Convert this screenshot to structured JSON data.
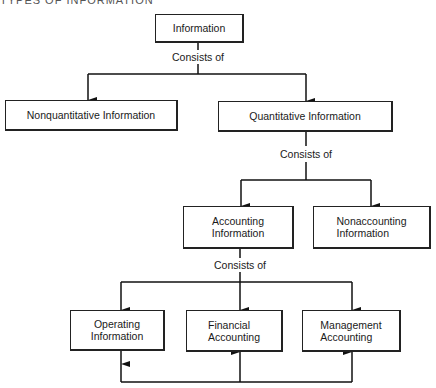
{
  "title": "TYPES OF INFORMATION",
  "connector_label": "Consists of",
  "nodes": {
    "information": "Information",
    "nonquantitative": "Nonquantitative Information",
    "quantitative": "Quantitative Information",
    "accounting": [
      "Accounting",
      "Information"
    ],
    "nonaccounting": [
      "Nonaccounting",
      "Information"
    ],
    "operating": [
      "Operating",
      "Information"
    ],
    "financial": [
      "Financial",
      "Accounting"
    ],
    "management": [
      "Management",
      "Accounting"
    ]
  },
  "edges": [
    {
      "from": "information",
      "to": "nonquantitative",
      "label": "Consists of"
    },
    {
      "from": "information",
      "to": "quantitative",
      "label": "Consists of"
    },
    {
      "from": "quantitative",
      "to": "accounting",
      "label": "Consists of"
    },
    {
      "from": "quantitative",
      "to": "nonaccounting",
      "label": "Consists of"
    },
    {
      "from": "accounting",
      "to": "operating",
      "label": "Consists of"
    },
    {
      "from": "accounting",
      "to": "financial",
      "label": "Consists of"
    },
    {
      "from": "accounting",
      "to": "management",
      "label": "Consists of"
    },
    {
      "from": "operating",
      "to": "financial"
    },
    {
      "from": "operating",
      "to": "management"
    }
  ]
}
